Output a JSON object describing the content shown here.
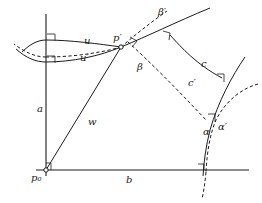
{
  "figure": {
    "type": "geometry-diagram",
    "stroke_color": "#1c1c1c",
    "background_color": "#ffffff",
    "width": 262,
    "height": 203
  },
  "labels": {
    "p_zero": "p₀",
    "p_prime": "p′",
    "a": "a",
    "b": "b",
    "w": "w",
    "u": "u",
    "u_prime": "u′",
    "beta": "β",
    "beta_prime": "β′",
    "c": "c",
    "c_prime": "c′",
    "alpha": "α",
    "alpha_prime": "α′"
  },
  "vertices": {
    "p_zero": [
      46,
      170
    ],
    "p_prime": [
      120,
      47
    ],
    "axis_vertical_top": [
      46,
      14
    ],
    "axis_horizontal_right": [
      246,
      170
    ],
    "bottom_crossing": [
      203,
      170
    ]
  },
  "right_angle_markers": [
    {
      "name": "u-axis-upper",
      "at": [
        46,
        40
      ]
    },
    {
      "name": "u-axis-lower",
      "at": [
        46,
        62
      ]
    },
    {
      "name": "p0-corner",
      "at": [
        46,
        170
      ]
    },
    {
      "name": "p-prime-beta-prime",
      "at": [
        133,
        41
      ]
    },
    {
      "name": "beta-prime-crosses-c",
      "at": [
        168,
        37
      ]
    },
    {
      "name": "c-crosses-right-curve",
      "at": [
        223,
        79
      ]
    },
    {
      "name": "alpha-crossing",
      "at": [
        213,
        118
      ]
    },
    {
      "name": "bottom-axis-crossing",
      "at": [
        203,
        170
      ]
    }
  ]
}
